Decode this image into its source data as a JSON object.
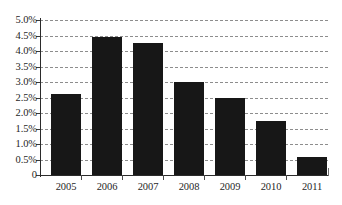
{
  "chart_data": {
    "type": "bar",
    "title": "",
    "subtitle": "",
    "xlabel": "",
    "ylabel": "",
    "categories": [
      "2005",
      "2006",
      "2007",
      "2008",
      "2009",
      "2010",
      "2011"
    ],
    "values": [
      2.62,
      4.45,
      4.25,
      3.0,
      2.47,
      1.75,
      0.58
    ],
    "series": [
      {
        "name": "",
        "values": [
          2.62,
          4.45,
          4.25,
          3.0,
          2.47,
          1.75,
          0.58
        ]
      }
    ],
    "ylim": [
      0,
      5.0
    ],
    "ytick_values": [
      5.0,
      4.5,
      4.0,
      3.5,
      3.0,
      2.5,
      2.0,
      1.5,
      1.0,
      0.5,
      0
    ],
    "ytick_labels": [
      "5.0%",
      "4.5%",
      "4.0%",
      "3.5%",
      "3.0%",
      "2.5%",
      "2.0%",
      "1.5%",
      "1.0%",
      "0.5%",
      "0"
    ],
    "grid": true,
    "grid_style": "dashed-horizontal",
    "legend": false,
    "legend_position": "none",
    "annotations": [],
    "colors": {
      "bar": "#171717",
      "grid": "#8d8d8d",
      "axis": "#2b2b2b",
      "text": "#1f1f1f",
      "background": "#ffffff"
    }
  }
}
